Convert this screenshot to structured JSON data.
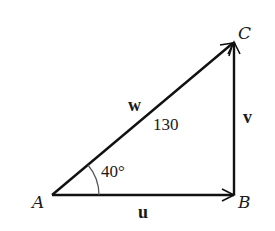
{
  "diagram": {
    "type": "vector right triangle",
    "vertices": [
      {
        "id": "A",
        "label": "A"
      },
      {
        "id": "B",
        "label": "B"
      },
      {
        "id": "C",
        "label": "C"
      }
    ],
    "vectors": [
      {
        "id": "u",
        "label": "u",
        "from": "A",
        "to": "B"
      },
      {
        "id": "v",
        "label": "v",
        "from": "B",
        "to": "C"
      },
      {
        "id": "w",
        "label": "w",
        "from": "A",
        "to": "C",
        "magnitude": "130"
      }
    ],
    "angle": {
      "at": "A",
      "label": "40°"
    },
    "colors": {
      "stroke": "#111111",
      "arc": "#555555",
      "background": "#ffffff"
    }
  }
}
